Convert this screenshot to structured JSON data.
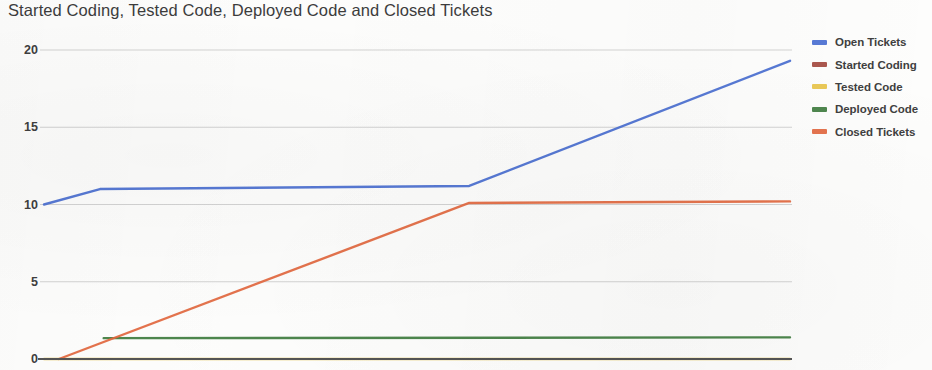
{
  "chart_data": {
    "type": "line",
    "title": "Started Coding, Tested Code, Deployed Code and Closed Tickets",
    "xlabel": "",
    "ylabel": "",
    "ylim": [
      0,
      20
    ],
    "xlim": [
      0,
      100
    ],
    "y_ticks": [
      0,
      5,
      10,
      15,
      20
    ],
    "y_tick_labels": [
      "0",
      "5",
      "10",
      "15",
      "20"
    ],
    "x_ticks": [],
    "x_tick_labels": [],
    "grid": "horizontal",
    "legend_position": "right",
    "series": [
      {
        "name": "Open Tickets",
        "color": "#4a6fd1",
        "x": [
          0,
          7.5,
          57,
          100
        ],
        "values": [
          10,
          11,
          11.2,
          19.3
        ]
      },
      {
        "name": "Started Coding",
        "color": "#a44a3f",
        "x": [],
        "values": []
      },
      {
        "name": "Tested Code",
        "color": "#e8c44a",
        "x": [
          0,
          100
        ],
        "values": [
          0,
          0
        ]
      },
      {
        "name": "Deployed Code",
        "color": "#3f7d3f",
        "x": [
          8,
          100
        ],
        "values": [
          1.35,
          1.4
        ]
      },
      {
        "name": "Closed Tickets",
        "color": "#e2683f",
        "x": [
          2,
          57,
          100
        ],
        "values": [
          0,
          10.1,
          10.2
        ]
      }
    ]
  },
  "axis": {
    "baseline_color": "#555555",
    "gridline_color": "#c9c9c9"
  },
  "plot_geometry": {
    "left": 44,
    "right": 790,
    "top": 50,
    "bottom": 359
  }
}
